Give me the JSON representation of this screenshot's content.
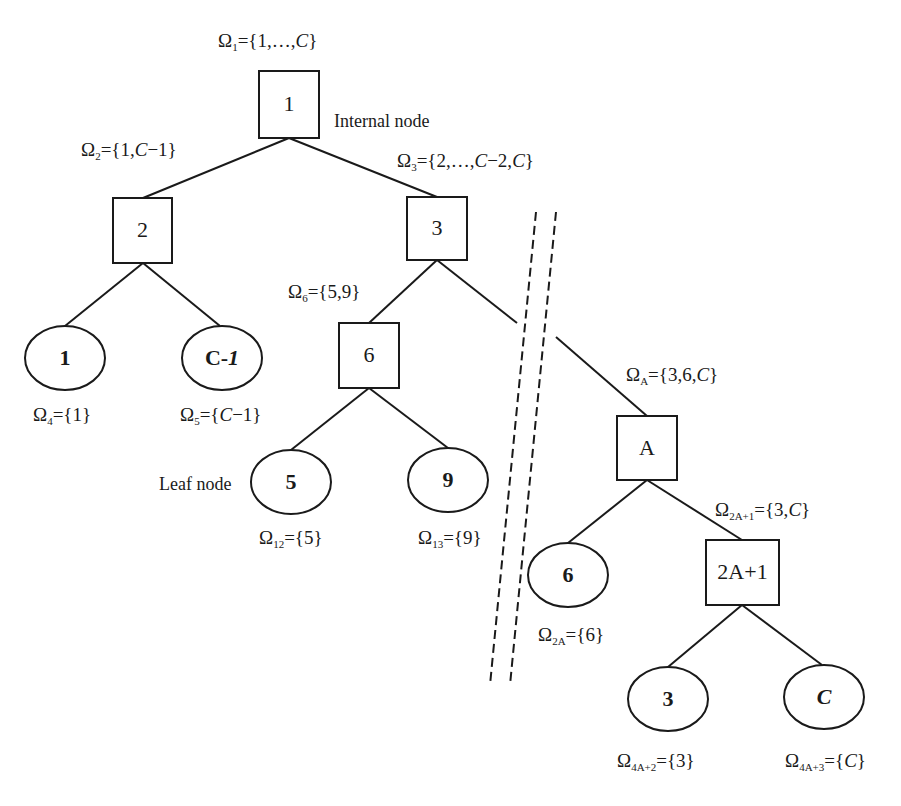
{
  "diagram": {
    "type": "binary-tree",
    "annotations": {
      "internal_node": "Internal node",
      "leaf_node": "Leaf node"
    },
    "colors": {
      "stroke": "#1a1a1a",
      "background": "#ffffff"
    },
    "internal_nodes": [
      {
        "id": "1",
        "label": "1"
      },
      {
        "id": "2",
        "label": "2"
      },
      {
        "id": "3",
        "label": "3"
      },
      {
        "id": "6",
        "label": "6"
      },
      {
        "id": "A",
        "label": "A"
      },
      {
        "id": "2A+1",
        "label": "2A+1"
      }
    ],
    "leaf_nodes": [
      {
        "id": "leaf-1",
        "label": "1"
      },
      {
        "id": "leaf-C-1",
        "label_main": "C-",
        "label_italic": "1"
      },
      {
        "id": "leaf-5",
        "label": "5"
      },
      {
        "id": "leaf-9",
        "label": "9"
      },
      {
        "id": "leaf-6",
        "label": "6"
      },
      {
        "id": "leaf-3",
        "label": "3"
      },
      {
        "id": "leaf-C",
        "label": "C"
      }
    ],
    "sets": {
      "omega1": {
        "sub": "1",
        "pre": "={1,…,",
        "var": "C",
        "post": "}"
      },
      "omega2": {
        "sub": "2",
        "pre": "={1,",
        "var": "C",
        "post": "−1}"
      },
      "omega3": {
        "sub": "3",
        "pre": "={2,…,",
        "var": "C",
        "mid": "−2,",
        "var2": "C",
        "post": "}"
      },
      "omega4": {
        "sub": "4",
        "pre": "={1}"
      },
      "omega5": {
        "sub": "5",
        "pre": "={",
        "var": "C",
        "post": "−1}"
      },
      "omega6": {
        "sub": "6",
        "pre": "={5,9}"
      },
      "omega12": {
        "sub": "12",
        "pre": "={5}"
      },
      "omega13": {
        "sub": "13",
        "pre": "={9}"
      },
      "omegaA": {
        "sub": "A",
        "pre": "={3,6,",
        "var": "C",
        "post": "}"
      },
      "omega2A1": {
        "sub": "2A+1",
        "pre": "={3,",
        "var": "C",
        "post": "}"
      },
      "omega2A": {
        "sub": "2A",
        "pre": "={6}"
      },
      "omega4A2": {
        "sub": "4A+2",
        "pre": "={3}"
      },
      "omega4A3": {
        "sub": "4A+3",
        "pre": "={",
        "var": "C",
        "post": "}"
      }
    },
    "omega_symbol": "Ω"
  }
}
